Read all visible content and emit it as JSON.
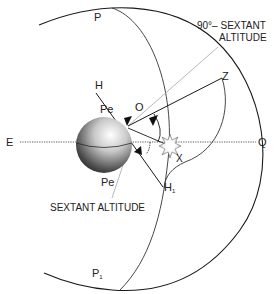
{
  "diagram": {
    "labels": {
      "pole_north": "P",
      "pole_south": "P",
      "pole_south_sub": "1",
      "zenith": "Z",
      "horizon_top": "H",
      "horizon_bottom": "H",
      "horizon_bottom_sub": "1",
      "observer": "O",
      "east": "E",
      "equator_point": "Q",
      "star": "X",
      "pe_top": "Pe",
      "pe_bottom": "Pe",
      "zenith_distance_line1": "90°– SEXTANT",
      "zenith_distance_line2": "ALTITUDE",
      "sextant_altitude": "SEXTANT ALTITUDE"
    },
    "colors": {
      "line": "#1a1a1a",
      "gray_line": "#b0b0b0",
      "sphere_light": "#f2f2f2",
      "sphere_dark": "#1e1e1e",
      "background": "#ffffff"
    }
  }
}
